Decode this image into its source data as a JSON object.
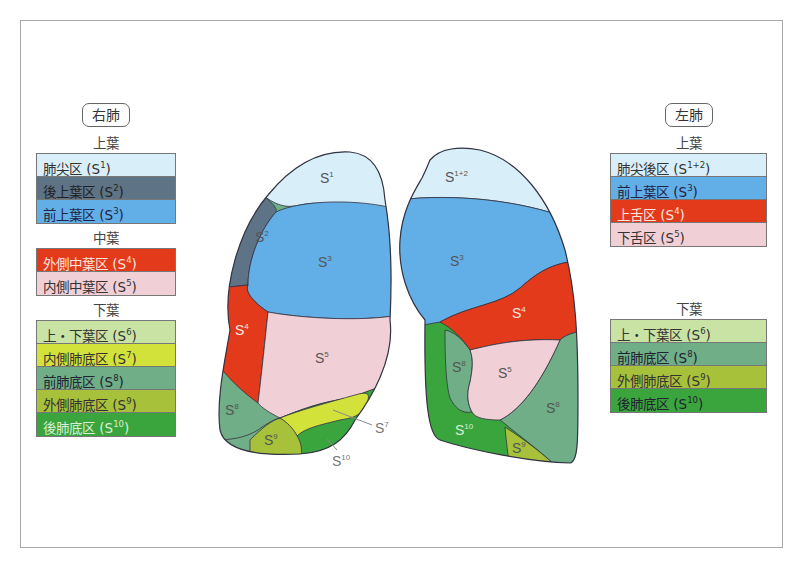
{
  "right_lung": {
    "title": "右肺",
    "lobes": [
      {
        "name": "上葉",
        "segments": [
          {
            "label": "肺尖区 (S",
            "sup": "1",
            "close": ")",
            "color": "#d8eef9",
            "text_color": "#333"
          },
          {
            "label": "後上葉区 (S",
            "sup": "2",
            "close": ")",
            "color": "#5e7385",
            "text_color": "#222"
          },
          {
            "label": "前上葉区 (S",
            "sup": "3",
            "close": ")",
            "color": "#62aee6",
            "text_color": "#224"
          }
        ]
      },
      {
        "name": "中葉",
        "segments": [
          {
            "label": "外側中葉区 (S",
            "sup": "4",
            "close": ")",
            "color": "#e33a1c",
            "text_color": "#fbe6dc"
          },
          {
            "label": "内側中葉区 (S",
            "sup": "5",
            "close": ")",
            "color": "#f1cfd6",
            "text_color": "#333"
          }
        ]
      },
      {
        "name": "下葉",
        "segments": [
          {
            "label": "上・下葉区 (S",
            "sup": "6",
            "close": ")",
            "color": "#c8e3a3",
            "text_color": "#333"
          },
          {
            "label": "内側肺底区 (S",
            "sup": "7",
            "close": ")",
            "color": "#d3e23a",
            "text_color": "#333"
          },
          {
            "label": "前肺底区 (S",
            "sup": "8",
            "close": ")",
            "color": "#6fae86",
            "text_color": "#223"
          },
          {
            "label": "外側肺底区 (S",
            "sup": "9",
            "close": ")",
            "color": "#a7c13a",
            "text_color": "#333"
          },
          {
            "label": "後肺底区 (S",
            "sup": "10",
            "close": ")",
            "color": "#3aa53c",
            "text_color": "#d8eed8"
          }
        ]
      }
    ]
  },
  "left_lung": {
    "title": "左肺",
    "lobes": [
      {
        "name": "上葉",
        "segments": [
          {
            "label": "肺尖後区 (S",
            "sup": "1+2",
            "close": ")",
            "color": "#d8eef9",
            "text_color": "#333"
          },
          {
            "label": "前上葉区 (S",
            "sup": "3",
            "close": ")",
            "color": "#62aee6",
            "text_color": "#224"
          },
          {
            "label": "上舌区 (S",
            "sup": "4",
            "close": ")",
            "color": "#e33a1c",
            "text_color": "#fbe6dc"
          },
          {
            "label": "下舌区 (S",
            "sup": "5",
            "close": ")",
            "color": "#f1cfd6",
            "text_color": "#333"
          }
        ]
      },
      {
        "name": "下葉",
        "segments": [
          {
            "label": "上・下葉区 (S",
            "sup": "6",
            "close": ")",
            "color": "#c8e3a3",
            "text_color": "#333"
          },
          {
            "label": "前肺底区 (S",
            "sup": "8",
            "close": ")",
            "color": "#6fae86",
            "text_color": "#223"
          },
          {
            "label": "外側肺底区 (S",
            "sup": "9",
            "close": ")",
            "color": "#a7c13a",
            "text_color": "#333"
          },
          {
            "label": "後肺底区 (S",
            "sup": "10",
            "close": ")",
            "color": "#3aa53c",
            "text_color": "#223"
          }
        ]
      }
    ]
  },
  "diagram_labels": {
    "right": {
      "s1": "S",
      "s1_sup": "1",
      "s2": "S",
      "s2_sup": "2",
      "s3": "S",
      "s3_sup": "3",
      "s4": "S",
      "s4_sup": "4",
      "s5": "S",
      "s5_sup": "5",
      "s7": "S",
      "s7_sup": "7",
      "s8": "S",
      "s8_sup": "8",
      "s9": "S",
      "s9_sup": "9",
      "s10": "S",
      "s10_sup": "10"
    },
    "left": {
      "s12": "S",
      "s12_sup": "1+2",
      "s3": "S",
      "s3_sup": "3",
      "s4": "S",
      "s4_sup": "4",
      "s5": "S",
      "s5_sup": "5",
      "s8a": "S",
      "s8a_sup": "8",
      "s8b": "S",
      "s8b_sup": "8",
      "s9": "S",
      "s9_sup": "9",
      "s10": "S",
      "s10_sup": "10"
    }
  }
}
